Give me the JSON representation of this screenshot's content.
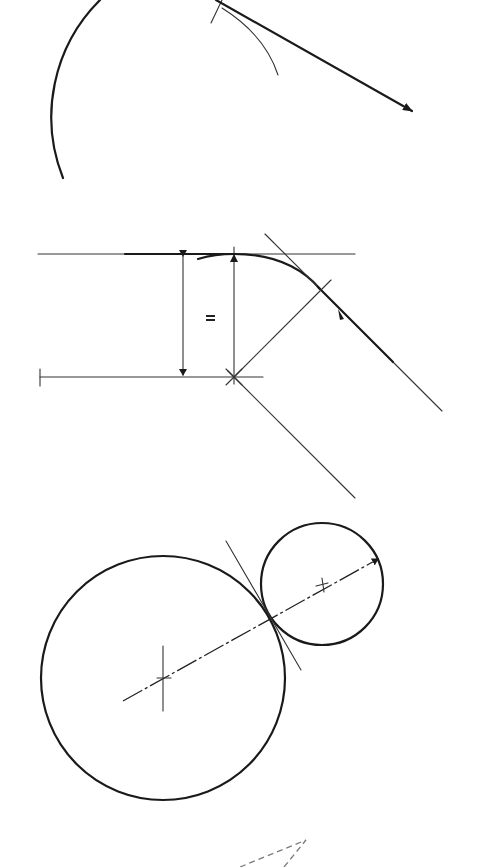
{
  "figure": {
    "background": "#ffffff",
    "ink_color": "#1a1a1a",
    "dashed_color": "#7a7a7a",
    "panels": [
      {
        "id": "arc-tangent",
        "description": "Arc with tangent arrow leaving from the top",
        "main_arc": {
          "cx": 200,
          "cy": 100,
          "r": 165,
          "from_deg": 248,
          "to_deg": 148
        },
        "small_arc": {
          "x1": 222,
          "y1": 8,
          "x2": 278,
          "y2": 75
        },
        "tick": {
          "x1": 210,
          "y1": 22,
          "x2": 222,
          "y2": 0
        },
        "arrow": {
          "x1": 216,
          "y1": 0,
          "x2": 412,
          "y2": 112
        }
      },
      {
        "id": "fillet-construction",
        "description": "Fillet between horizontal line and inclined line with equal-distance marking",
        "top_line": {
          "x1": 38,
          "y1": 254,
          "x2": 355,
          "y2": 254
        },
        "bottom_line": {
          "x1": 40,
          "y1": 377,
          "x2": 263,
          "y2": 377
        },
        "dimension_left": {
          "x": 183,
          "y1": 254,
          "y2": 377
        },
        "dimension_right": {
          "x": 234,
          "y1": 254,
          "y2": 377
        },
        "equal_mark": "=",
        "center_point": {
          "x": 234,
          "y": 377
        },
        "fillet_arc": {
          "start": [
            200,
            259
          ],
          "end": [
            320,
            289
          ]
        },
        "inclined_line": {
          "x1": 265,
          "y1": 234,
          "x2": 442,
          "y2": 411
        },
        "inclined_parallel": {
          "x1": 234,
          "y1": 377,
          "x2": 355,
          "y2": 498
        },
        "radius_line": {
          "x1": 234,
          "y1": 377,
          "x2": 330,
          "y2": 281
        }
      },
      {
        "id": "tangent-circles",
        "description": "Two externally tangent circles with center line and common tangent",
        "large_circle": {
          "cx": 163,
          "cy": 678,
          "r": 122
        },
        "small_circle": {
          "cx": 322,
          "cy": 584,
          "r": 61
        },
        "center_line": {
          "x1": 123,
          "y1": 701,
          "x2": 380,
          "y2": 558
        },
        "tangent_line": {
          "x1": 226,
          "y1": 541,
          "x2": 301,
          "y2": 670
        },
        "large_center_mark": {
          "x": 163,
          "y": 678
        },
        "small_center_mark": {
          "x": 322,
          "y": 584
        }
      },
      {
        "id": "dashed-triangle",
        "description": "Partially visible dashed construction triangle at page bottom",
        "lines": [
          {
            "x1": 240,
            "y1": 867,
            "x2": 306,
            "y2": 840
          },
          {
            "x1": 284,
            "y1": 867,
            "x2": 306,
            "y2": 840
          }
        ]
      }
    ]
  }
}
